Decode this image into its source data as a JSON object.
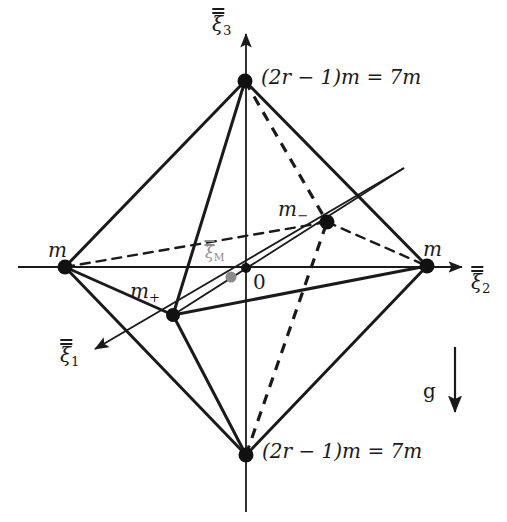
{
  "figure": {
    "background_color": "#ffffff",
    "line_color": "#1a1a1a",
    "accent_grey": "#8c8c8c",
    "width": 507,
    "height": 522
  },
  "axes": [
    {
      "id": "xi1",
      "name": "axis-xi1",
      "symbol": "ξ",
      "subscript": "1",
      "accent": "double-bar",
      "label_x": 60,
      "label_y": 345,
      "direction": "down-left"
    },
    {
      "id": "xi2",
      "name": "axis-xi2",
      "symbol": "ξ",
      "subscript": "2",
      "accent": "double-bar",
      "label_x": 471,
      "label_y": 272,
      "direction": "right"
    },
    {
      "id": "xi3",
      "name": "axis-xi3",
      "symbol": "ξ",
      "subscript": "3",
      "accent": "double-bar",
      "label_x": 212,
      "label_y": 14,
      "direction": "up"
    }
  ],
  "origin": {
    "label": "0",
    "x": 246,
    "y": 268,
    "label_x": 253,
    "label_y": 272
  },
  "center_of_mass": {
    "symbol": "ξ",
    "subscript": "M",
    "accent": "double-bar",
    "color": "#8c8c8c",
    "dot_x": 231,
    "dot_y": 277,
    "label_x": 205,
    "label_y": 245
  },
  "vertices": [
    {
      "id": "top",
      "name": "vertex-top",
      "x": 245,
      "y": 81,
      "label": "(2r − 1)m = 7m",
      "label_x": 261,
      "label_y": 67
    },
    {
      "id": "bottom",
      "name": "vertex-bottom",
      "x": 246,
      "y": 455,
      "label": "(2r − 1)m = 7m",
      "label_x": 262,
      "label_y": 441
    },
    {
      "id": "left",
      "name": "vertex-left-m",
      "x": 65,
      "y": 267,
      "label": "m",
      "label_x": 48,
      "label_y": 240
    },
    {
      "id": "right",
      "name": "vertex-right-m",
      "x": 427,
      "y": 266,
      "label": "m",
      "label_x": 423,
      "label_y": 239
    },
    {
      "id": "front",
      "name": "vertex-m-plus",
      "x": 173,
      "y": 315,
      "label": "m",
      "subscript": "+",
      "label_x": 130,
      "label_y": 281
    },
    {
      "id": "back",
      "name": "vertex-m-minus",
      "x": 327,
      "y": 222,
      "label": "m",
      "subscript": "−",
      "label_x": 278,
      "label_y": 199
    }
  ],
  "gravity": {
    "label": "g",
    "label_x": 423,
    "label_y": 381,
    "arrow_x": 455,
    "arrow_top": 347,
    "arrow_bottom": 420
  }
}
